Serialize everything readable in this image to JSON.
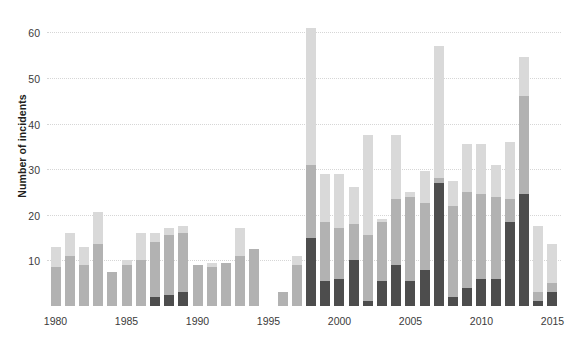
{
  "chart_data": {
    "type": "bar",
    "title": "",
    "subtitle": "",
    "xlabel": "",
    "ylabel": "Number of incidents",
    "stacked": true,
    "grid": true,
    "legend": "none",
    "ylim": [
      0,
      64
    ],
    "yticks": [
      10,
      20,
      30,
      40,
      50,
      60
    ],
    "xlim": [
      1979.4,
      2015.6
    ],
    "xticks": [
      1980,
      1985,
      1990,
      1995,
      2000,
      2005,
      2010,
      2015
    ],
    "xticklabels": [
      "1980",
      "1985",
      "1990",
      "1995",
      "2000",
      "2005",
      "2010",
      "2015"
    ],
    "categories": [
      1980,
      1981,
      1982,
      1983,
      1984,
      1985,
      1986,
      1987,
      1988,
      1989,
      1990,
      1991,
      1992,
      1993,
      1994,
      1995,
      1996,
      1997,
      1998,
      1999,
      2000,
      2001,
      2002,
      2003,
      2004,
      2005,
      2006,
      2007,
      2008,
      2009,
      2010,
      2011,
      2012,
      2013,
      2014,
      2015
    ],
    "series": [
      {
        "name": "dark-segment",
        "color": "#4d4d4d",
        "values": [
          0,
          0,
          0,
          0,
          0,
          0,
          0,
          2,
          2.5,
          3,
          0,
          0,
          0,
          0,
          0,
          0,
          0,
          0,
          15,
          5.5,
          6,
          10,
          1,
          5.5,
          9,
          5.5,
          8,
          27,
          2,
          4,
          6,
          6,
          18.5,
          24.5,
          1,
          3
        ]
      },
      {
        "name": "mid-segment",
        "color": "#b2b2b2",
        "values": [
          8.5,
          11,
          9,
          13.5,
          7.5,
          9,
          10,
          12,
          13,
          13,
          9,
          8.5,
          9.5,
          11,
          12.5,
          0,
          3,
          9,
          16,
          13,
          11,
          8,
          14.5,
          13,
          14.5,
          18.5,
          14.5,
          1,
          20,
          21,
          18.5,
          18,
          5,
          21.5,
          2,
          2
        ]
      },
      {
        "name": "light-segment",
        "color": "#d9d9d9",
        "values": [
          4.5,
          5,
          4,
          7,
          0,
          1,
          6,
          2,
          1.5,
          1.5,
          0,
          1,
          0,
          6,
          0,
          0,
          0,
          2,
          30,
          10.5,
          12,
          8,
          22,
          0.5,
          14,
          1,
          7,
          29,
          5.5,
          10.5,
          11,
          7,
          12.5,
          8.5,
          14.5,
          8.5
        ]
      }
    ],
    "totals": [
      13,
      16,
      13,
      20.5,
      7.5,
      10,
      16,
      16,
      17,
      17.5,
      9,
      9.5,
      9.5,
      17,
      12.5,
      0,
      3,
      11,
      61,
      29,
      29,
      26,
      37.5,
      19,
      37.5,
      25,
      29.5,
      57,
      27.5,
      35.5,
      35.5,
      31,
      36,
      54.5,
      17.5,
      13.5
    ]
  }
}
